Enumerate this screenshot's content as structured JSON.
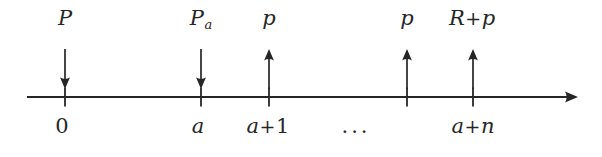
{
  "figure": {
    "type": "number-line-diagram",
    "background_color": "#ffffff",
    "ink_color": "#262626",
    "axis": {
      "y": 97,
      "x_start": 27,
      "x_end": 578,
      "has_right_arrowhead": true,
      "tick_positions": [
        65,
        201,
        269,
        407,
        473
      ]
    },
    "top_labels": [
      {
        "id": "P",
        "text": "P",
        "base": "P",
        "sub": "",
        "x": 65
      },
      {
        "id": "Pa",
        "text": "Pa",
        "base": "P",
        "sub": "a",
        "x": 201
      },
      {
        "id": "p1",
        "text": "p",
        "base": "p",
        "sub": "",
        "x": 269
      },
      {
        "id": "p2",
        "text": "p",
        "base": "p",
        "sub": "",
        "x": 407
      },
      {
        "id": "Rp",
        "text": "R+p",
        "left": "R",
        "op": "+",
        "right": "p",
        "x": 472
      }
    ],
    "arrows": [
      {
        "id": "arrow-1",
        "direction": "down",
        "x": 65
      },
      {
        "id": "arrow-2",
        "direction": "down",
        "x": 201
      },
      {
        "id": "arrow-3",
        "direction": "up",
        "x": 269
      },
      {
        "id": "arrow-4",
        "direction": "up",
        "x": 407
      },
      {
        "id": "arrow-5",
        "direction": "up",
        "x": 473
      }
    ],
    "bottom_labels": [
      {
        "id": "zero",
        "text": "0",
        "kind": "number",
        "x": 62
      },
      {
        "id": "a",
        "text": "a",
        "kind": "italic",
        "x": 198
      },
      {
        "id": "a-plus-1",
        "left": "a",
        "op": "+",
        "right": "1",
        "kind": "expr",
        "x": 268
      },
      {
        "id": "ellipsis",
        "text": "...",
        "kind": "dots",
        "x": 356
      },
      {
        "id": "a-plus-n",
        "left": "a",
        "op": "+",
        "right": "n",
        "kind": "expr",
        "x": 473
      }
    ]
  }
}
